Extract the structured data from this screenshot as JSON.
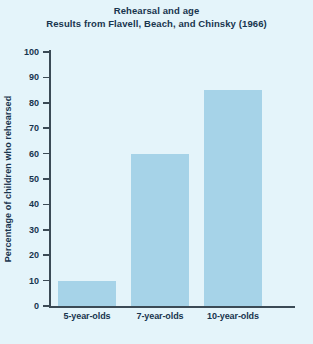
{
  "chart_data": {
    "type": "bar",
    "title": "Rehearsal and age",
    "subtitle": "Results from Flavell, Beach, and Chinsky (1966)",
    "xlabel": "",
    "ylabel": "Percentage of children who rehearsed",
    "categories": [
      "5-year-olds",
      "7-year-olds",
      "10-year-olds"
    ],
    "values": [
      10,
      60,
      85
    ],
    "ylim": [
      0,
      100
    ],
    "ytick_labels": [
      "0",
      "10",
      "20",
      "30",
      "40",
      "50",
      "60",
      "70",
      "80",
      "90",
      "100"
    ],
    "ytick_values": [
      0,
      10,
      20,
      30,
      40,
      50,
      60,
      70,
      80,
      90,
      100
    ],
    "grid": false,
    "legend": false,
    "colors": {
      "background": "#e4f4fa",
      "bar_fill": "#a6d3e8",
      "axis": "#3b4a55",
      "text": "#18344e"
    }
  }
}
